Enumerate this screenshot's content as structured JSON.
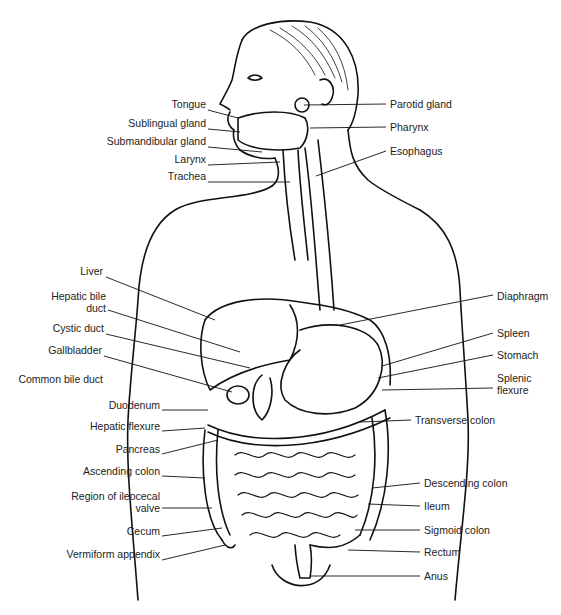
{
  "diagram": {
    "colors": {
      "line": "#111111",
      "text": "#222222",
      "background": "#ffffff"
    },
    "labels_left": [
      {
        "id": "tongue",
        "text": "Tongue",
        "x": 206,
        "y": 104
      },
      {
        "id": "sublingual-gland",
        "text": "Sublingual gland",
        "x": 206,
        "y": 123
      },
      {
        "id": "submandibular-gland",
        "text": "Submandibular gland",
        "x": 206,
        "y": 141
      },
      {
        "id": "larynx",
        "text": "Larynx",
        "x": 206,
        "y": 159
      },
      {
        "id": "trachea",
        "text": "Trachea",
        "x": 206,
        "y": 176
      },
      {
        "id": "liver",
        "text": "Liver",
        "x": 103,
        "y": 271
      },
      {
        "id": "hepatic-bile-duct",
        "text": "Hepatic bile\nduct",
        "x": 106,
        "y": 296
      },
      {
        "id": "cystic-duct",
        "text": "Cystic duct",
        "x": 104,
        "y": 328
      },
      {
        "id": "gallbladder",
        "text": "Gallbladder",
        "x": 102,
        "y": 350
      },
      {
        "id": "common-bile-duct",
        "text": "Common bile duct",
        "x": 103,
        "y": 379
      },
      {
        "id": "duodenum",
        "text": "Duodenum",
        "x": 160,
        "y": 405
      },
      {
        "id": "hepatic-flexure",
        "text": "Hepatic flexure",
        "x": 160,
        "y": 426
      },
      {
        "id": "pancreas",
        "text": "Pancreas",
        "x": 160,
        "y": 449
      },
      {
        "id": "ascending-colon",
        "text": "Ascending colon",
        "x": 160,
        "y": 471
      },
      {
        "id": "region-of-ileocecal-valve",
        "text": "Region of ileocecal\nvalve",
        "x": 160,
        "y": 496
      },
      {
        "id": "cecum",
        "text": "Cecum",
        "x": 160,
        "y": 531
      },
      {
        "id": "vermiform-appendix",
        "text": "Vermiform appendix",
        "x": 160,
        "y": 554
      }
    ],
    "labels_right": [
      {
        "id": "parotid-gland",
        "text": "Parotid gland",
        "x": 390,
        "y": 98
      },
      {
        "id": "pharynx",
        "text": "Pharynx",
        "x": 390,
        "y": 121
      },
      {
        "id": "esophagus",
        "text": "Esophagus",
        "x": 390,
        "y": 145
      },
      {
        "id": "diaphragm",
        "text": "Diaphragm",
        "x": 497,
        "y": 290
      },
      {
        "id": "spleen",
        "text": "Spleen",
        "x": 497,
        "y": 327
      },
      {
        "id": "stomach",
        "text": "Stomach",
        "x": 497,
        "y": 349
      },
      {
        "id": "splenic-flexure",
        "text": "Splenic\nflexure",
        "x": 497,
        "y": 372
      },
      {
        "id": "transverse-colon",
        "text": "Transverse colon",
        "x": 415,
        "y": 414
      },
      {
        "id": "descending-colon",
        "text": "Descending colon",
        "x": 424,
        "y": 477
      },
      {
        "id": "ileum",
        "text": "Ileum",
        "x": 424,
        "y": 500
      },
      {
        "id": "sigmoid-colon",
        "text": "Sigmoid colon",
        "x": 424,
        "y": 524
      },
      {
        "id": "rectum",
        "text": "Rectum",
        "x": 424,
        "y": 546
      },
      {
        "id": "anus",
        "text": "Anus",
        "x": 424,
        "y": 570
      }
    ]
  }
}
